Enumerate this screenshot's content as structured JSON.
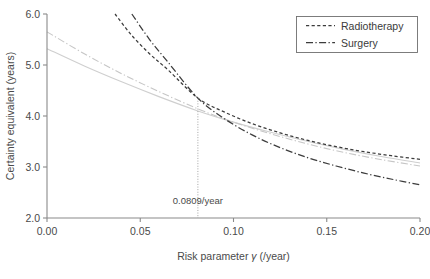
{
  "chart_data": {
    "type": "line",
    "title": "",
    "xlabel": "Risk parameter γ (/year)",
    "xlabel_prefix": "Risk parameter ",
    "xlabel_symbol": "γ",
    "xlabel_suffix": " (/year)",
    "ylabel": "Certainty equivalent (years)",
    "xlim": [
      0.0,
      0.2
    ],
    "ylim": [
      2.0,
      6.0
    ],
    "xticks": [
      "0.00",
      "0.05",
      "0.10",
      "0.15",
      "0.20"
    ],
    "xtick_values": [
      0.0,
      0.05,
      0.1,
      0.15,
      0.2
    ],
    "yticks": [
      "2.0",
      "3.0",
      "4.0",
      "5.0",
      "6.0"
    ],
    "ytick_values": [
      2.0,
      3.0,
      4.0,
      5.0,
      6.0
    ],
    "grid": false,
    "legend_position": "top-right",
    "annotations": [
      {
        "text": "0.0809/year",
        "x": 0.0809,
        "y": 2.28,
        "marker": "vertical-dotted-line",
        "line_from_y": 4.35,
        "line_to_y": 2.0
      }
    ],
    "series": [
      {
        "name": "Radiotherapy",
        "style": "dashed",
        "color": "#3c3c3c",
        "legend": true,
        "x": [
          0.0365,
          0.045,
          0.055,
          0.065,
          0.0809,
          0.095,
          0.11,
          0.125,
          0.14,
          0.155,
          0.17,
          0.185,
          0.2
        ],
        "y": [
          6.0,
          5.6,
          5.22,
          4.9,
          4.35,
          4.08,
          3.85,
          3.67,
          3.52,
          3.4,
          3.3,
          3.22,
          3.15
        ]
      },
      {
        "name": "Surgery",
        "style": "dashdot",
        "color": "#3c3c3c",
        "legend": true,
        "x": [
          0.0455,
          0.055,
          0.065,
          0.0809,
          0.095,
          0.11,
          0.125,
          0.14,
          0.155,
          0.17,
          0.185,
          0.2
        ],
        "y": [
          6.0,
          5.5,
          5.05,
          4.35,
          3.95,
          3.63,
          3.38,
          3.18,
          3.02,
          2.88,
          2.76,
          2.65
        ]
      },
      {
        "name": "Radiotherapy (low)",
        "style": "dashdot",
        "color": "#c6c6c6",
        "legend": false,
        "x": [
          0.0,
          0.02,
          0.04,
          0.06,
          0.0809,
          0.1,
          0.12,
          0.14,
          0.16,
          0.18,
          0.2
        ],
        "y": [
          5.65,
          5.22,
          4.83,
          4.48,
          4.14,
          3.88,
          3.65,
          3.45,
          3.28,
          3.14,
          3.02
        ]
      },
      {
        "name": "Surgery (low)",
        "style": "solid",
        "color": "#cfcfcf",
        "legend": false,
        "x": [
          0.0,
          0.02,
          0.04,
          0.06,
          0.0809,
          0.1,
          0.12,
          0.14,
          0.16,
          0.18,
          0.2
        ],
        "y": [
          5.32,
          4.98,
          4.67,
          4.38,
          4.1,
          3.88,
          3.68,
          3.5,
          3.34,
          3.2,
          3.08
        ]
      }
    ]
  },
  "legend": {
    "items": [
      {
        "label": "Radiotherapy",
        "style": "dashed"
      },
      {
        "label": "Surgery",
        "style": "dashdot"
      }
    ]
  }
}
